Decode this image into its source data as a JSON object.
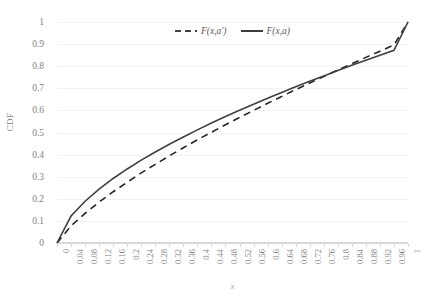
{
  "chart_data": {
    "type": "line",
    "title": "",
    "xlabel": "x",
    "ylabel": "CDF",
    "xlim": [
      0,
      1
    ],
    "ylim": [
      0,
      1
    ],
    "grid": "horizontal",
    "legend_position": "top-center",
    "x_tick_labels": [
      "0",
      "0.04",
      "0.08",
      "0.12",
      "0.16",
      "0.2",
      "0.24",
      "0.28",
      "0.32",
      "0.36",
      "0.4",
      "0.44",
      "0.48",
      "0.52",
      "0.56",
      "0.6",
      "0.64",
      "0.68",
      "0.72",
      "0.76",
      "0.8",
      "0.84",
      "0.88",
      "0.92",
      "0.96",
      "1"
    ],
    "y_tick_labels": [
      "0",
      "0.1",
      "0.2",
      "0.3",
      "0.4",
      "0.5",
      "0.6",
      "0.7",
      "0.8",
      "0.9",
      "1"
    ],
    "x": [
      0,
      0.04,
      0.08,
      0.12,
      0.16,
      0.2,
      0.24,
      0.28,
      0.32,
      0.36,
      0.4,
      0.44,
      0.48,
      0.52,
      0.56,
      0.6,
      0.64,
      0.68,
      0.72,
      0.76,
      0.8,
      0.84,
      0.88,
      0.92,
      0.96,
      1
    ],
    "series": [
      {
        "name": "F(x,a')",
        "style": "dashed",
        "color": "#404040",
        "values": [
          0,
          0.122,
          0.189,
          0.244,
          0.292,
          0.335,
          0.375,
          0.412,
          0.447,
          0.48,
          0.512,
          0.543,
          0.572,
          0.601,
          0.628,
          0.655,
          0.681,
          0.707,
          0.732,
          0.756,
          0.78,
          0.804,
          0.827,
          0.85,
          0.872,
          1.0
        ]
      },
      {
        "name": "F(x,a)",
        "style": "solid",
        "color": "#262626",
        "values": [
          0,
          0.077,
          0.134,
          0.185,
          0.232,
          0.275,
          0.317,
          0.356,
          0.394,
          0.431,
          0.467,
          0.501,
          0.535,
          0.568,
          0.6,
          0.632,
          0.663,
          0.694,
          0.724,
          0.753,
          0.783,
          0.811,
          0.84,
          0.868,
          0.896,
          1.0
        ]
      }
    ]
  },
  "legend": {
    "items": [
      {
        "label": "F(x,a′)",
        "style": "dashed"
      },
      {
        "label": "F(x,a)",
        "style": "solid"
      }
    ]
  },
  "axes": {
    "y_title": "CDF",
    "x_title": "x"
  }
}
